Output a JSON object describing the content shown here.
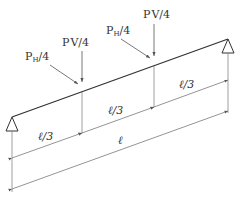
{
  "diagram": {
    "loads": [
      {
        "id": "ph1",
        "label_main": "P",
        "label_sub": "H",
        "label_suffix": "/4"
      },
      {
        "id": "pv1",
        "label_main": "P",
        "label_sub": "V",
        "label_suffix": "/4"
      },
      {
        "id": "ph2",
        "label_main": "P",
        "label_sub": "H",
        "label_suffix": "/4"
      },
      {
        "id": "pv2",
        "label_main": "P",
        "label_sub": "V",
        "label_suffix": "/4"
      }
    ],
    "dimensions": {
      "segment_1": "ℓ/3",
      "segment_2": "ℓ/3",
      "segment_3": "ℓ/3",
      "total": "ℓ"
    },
    "supports": [
      "left-pin",
      "right-pin"
    ],
    "colors": {
      "line": "#333333",
      "dim_line": "#666666",
      "background": "#ffffff"
    }
  }
}
